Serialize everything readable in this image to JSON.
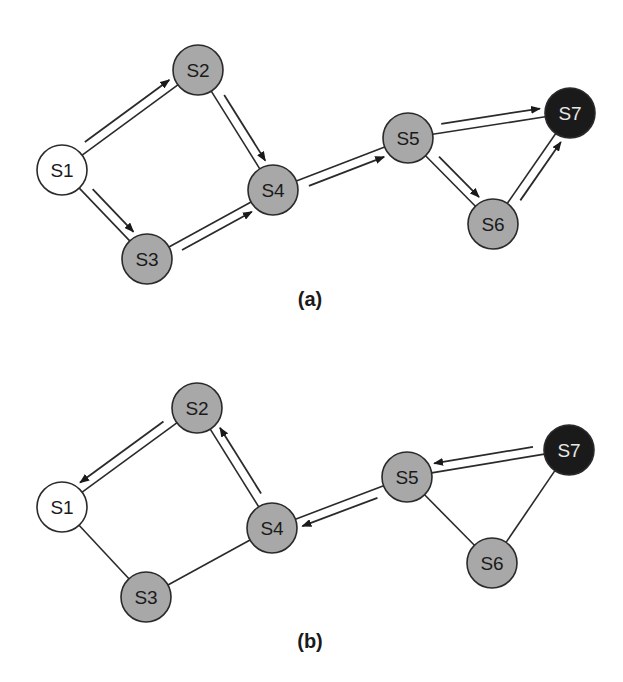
{
  "figure": {
    "colors": {
      "start": "#ffffff",
      "visited": "#a8a8a8",
      "target": "#1a1a1a",
      "stroke": "#2a2a2a",
      "label_dark": "#1a1a1a",
      "label_light": "#e8e8e8"
    },
    "node_radius": 25,
    "panels": [
      {
        "id": "a",
        "caption": "(a)",
        "caption_pos": [
          310,
          306
        ],
        "nodes": [
          {
            "id": "S1",
            "label": "S1",
            "x": 62,
            "y": 170,
            "type": "start"
          },
          {
            "id": "S2",
            "label": "S2",
            "x": 198,
            "y": 70,
            "type": "visited"
          },
          {
            "id": "S3",
            "label": "S3",
            "x": 147,
            "y": 259,
            "type": "visited"
          },
          {
            "id": "S4",
            "label": "S4",
            "x": 273,
            "y": 190,
            "type": "visited"
          },
          {
            "id": "S5",
            "label": "S5",
            "x": 408,
            "y": 138,
            "type": "visited"
          },
          {
            "id": "S6",
            "label": "S6",
            "x": 493,
            "y": 224,
            "type": "visited"
          },
          {
            "id": "S7",
            "label": "S7",
            "x": 570,
            "y": 113,
            "type": "target"
          }
        ],
        "edges": [
          {
            "from": "S1",
            "to": "S2",
            "arrow": "forward",
            "side": -1
          },
          {
            "from": "S1",
            "to": "S3",
            "arrow": "forward",
            "side": -1
          },
          {
            "from": "S2",
            "to": "S4",
            "arrow": "forward",
            "side": -1
          },
          {
            "from": "S3",
            "to": "S4",
            "arrow": "forward",
            "side": 1
          },
          {
            "from": "S4",
            "to": "S5",
            "arrow": "forward",
            "side": 1
          },
          {
            "from": "S5",
            "to": "S7",
            "arrow": "forward",
            "side": -1
          },
          {
            "from": "S5",
            "to": "S6",
            "arrow": "forward",
            "side": -1
          },
          {
            "from": "S6",
            "to": "S7",
            "arrow": "forward",
            "side": 1
          }
        ]
      },
      {
        "id": "b",
        "caption": "(b)",
        "caption_pos": [
          310,
          648
        ],
        "nodes": [
          {
            "id": "S1",
            "label": "S1",
            "x": 62,
            "y": 507,
            "type": "start"
          },
          {
            "id": "S2",
            "label": "S2",
            "x": 197,
            "y": 408,
            "type": "visited"
          },
          {
            "id": "S3",
            "label": "S3",
            "x": 146,
            "y": 597,
            "type": "visited"
          },
          {
            "id": "S4",
            "label": "S4",
            "x": 272,
            "y": 528,
            "type": "visited"
          },
          {
            "id": "S5",
            "label": "S5",
            "x": 407,
            "y": 477,
            "type": "visited"
          },
          {
            "id": "S6",
            "label": "S6",
            "x": 492,
            "y": 563,
            "type": "visited"
          },
          {
            "id": "S7",
            "label": "S7",
            "x": 569,
            "y": 450,
            "type": "target"
          }
        ],
        "edges": [
          {
            "from": "S2",
            "to": "S1",
            "arrow": "forward",
            "side": 1
          },
          {
            "from": "S1",
            "to": "S3",
            "arrow": "none"
          },
          {
            "from": "S4",
            "to": "S2",
            "arrow": "forward",
            "side": 1
          },
          {
            "from": "S3",
            "to": "S4",
            "arrow": "none"
          },
          {
            "from": "S5",
            "to": "S4",
            "arrow": "forward",
            "side": -1
          },
          {
            "from": "S7",
            "to": "S5",
            "arrow": "forward",
            "side": 1
          },
          {
            "from": "S5",
            "to": "S6",
            "arrow": "none"
          },
          {
            "from": "S6",
            "to": "S7",
            "arrow": "none"
          }
        ]
      }
    ]
  }
}
